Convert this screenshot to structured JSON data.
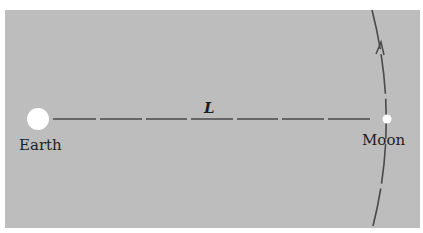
{
  "diagram": {
    "background_color": "#bdbdbd",
    "line_color": "#4a4a4a",
    "body_color": "#ffffff",
    "earth": {
      "label": "Earth"
    },
    "moon": {
      "label": "Moon"
    },
    "distance": {
      "label": "L"
    },
    "orbit": {
      "direction": "upward (counter-clockwise)"
    }
  }
}
